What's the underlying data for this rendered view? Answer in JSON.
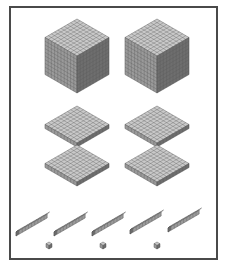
{
  "colors": {
    "frame": "#4a4a4a",
    "top": "#c9c9c9",
    "left": "#9a9a9a",
    "right": "#6e6e6e",
    "grid": "#5a5a5a"
  },
  "blocks": {
    "thousands": {
      "count": 2,
      "label": "thousand cube",
      "positions": [
        [
          77,
          19
        ],
        [
          157,
          19
        ]
      ],
      "size": 32
    },
    "hundreds": {
      "count": 4,
      "label": "hundred flat",
      "positions": [
        [
          77,
          106
        ],
        [
          157,
          106
        ],
        [
          77,
          145
        ],
        [
          157,
          145
        ]
      ],
      "size": 32,
      "thickness": 4
    },
    "tens": {
      "count": 5,
      "label": "ten rod",
      "positions": [
        [
          34,
          90
        ],
        [
          72,
          90
        ],
        [
          110,
          90
        ],
        [
          148,
          90
        ],
        [
          186,
          90
        ]
      ]
    },
    "ones": {
      "count": 3,
      "label": "unit cube",
      "positions": [
        [
          49,
          245
        ],
        [
          103,
          245
        ],
        [
          157,
          245
        ]
      ]
    }
  }
}
